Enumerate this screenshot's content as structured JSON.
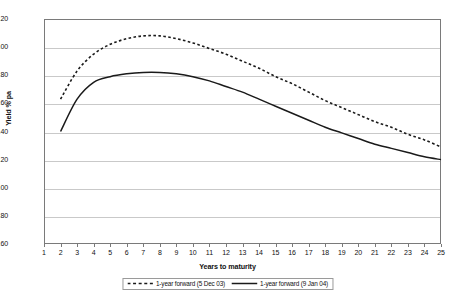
{
  "chart_data": {
    "type": "line",
    "title": "",
    "xlabel": "Years to maturity",
    "ylabel": "Yield % pa",
    "xlim": [
      1,
      25
    ],
    "ylim": [
      3.6,
      5.2
    ],
    "ytick_step": 0.2,
    "grid": true,
    "legend_position": "bottom-center",
    "xticks": [
      1,
      2,
      3,
      4,
      5,
      6,
      7,
      8,
      9,
      10,
      11,
      12,
      13,
      14,
      15,
      16,
      17,
      18,
      19,
      20,
      21,
      22,
      23,
      24,
      25
    ],
    "yticks": [
      "3.60",
      "3.80",
      "4.00",
      "4.20",
      "4.40",
      "4.60",
      "4.80",
      "5.00",
      "5.20"
    ],
    "x": [
      2,
      3,
      4,
      5,
      6,
      7,
      8,
      9,
      10,
      11,
      12,
      13,
      14,
      15,
      16,
      17,
      18,
      19,
      20,
      21,
      22,
      23,
      24,
      25
    ],
    "series": [
      {
        "name": "1-year forward (5 Dec 03)",
        "style": "dashed",
        "color": "#1a1a1a",
        "values": [
          4.63,
          4.83,
          4.95,
          5.02,
          5.06,
          5.08,
          5.08,
          5.06,
          5.03,
          4.99,
          4.95,
          4.9,
          4.85,
          4.79,
          4.74,
          4.68,
          4.62,
          4.57,
          4.52,
          4.47,
          4.43,
          4.38,
          4.34,
          4.29
        ]
      },
      {
        "name": "1-year forward (9 Jan 04)",
        "style": "solid",
        "color": "#1a1a1a",
        "values": [
          4.4,
          4.63,
          4.75,
          4.79,
          4.81,
          4.82,
          4.82,
          4.81,
          4.79,
          4.76,
          4.72,
          4.68,
          4.63,
          4.58,
          4.53,
          4.48,
          4.43,
          4.39,
          4.35,
          4.31,
          4.28,
          4.25,
          4.22,
          4.2
        ]
      }
    ]
  },
  "legend": {
    "entries": [
      {
        "label": "1-year forward (5 Dec 03)"
      },
      {
        "label": "1-year forward (9 Jan 04)"
      }
    ]
  },
  "axes": {
    "y_title": "Yield % pa",
    "x_title": "Years to maturity"
  }
}
